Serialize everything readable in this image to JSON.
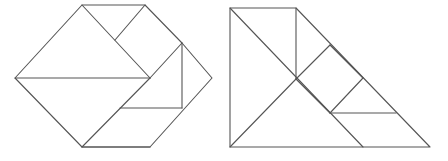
{
  "figure": {
    "name": "tangram-dissection-pair",
    "background_color": "#ffffff",
    "stroke_color": "#555555",
    "stroke_width": 1.1,
    "canvas": {
      "width": 448,
      "height": 161
    },
    "shapes": [
      {
        "id": "left-figure",
        "label": "left-tangram-hexagon",
        "outline": [
          [
            15,
            78
          ],
          [
            82,
            5
          ],
          [
            145,
            5
          ],
          [
            182,
            43
          ],
          [
            212,
            78
          ],
          [
            150,
            147
          ],
          [
            82,
            147
          ]
        ],
        "interior_segments": [
          {
            "name": "mid-horizontal",
            "points": [
              [
                15,
                78
              ],
              [
                150,
                78
              ]
            ]
          },
          {
            "name": "upper-left-diagonal",
            "points": [
              [
                82,
                5
              ],
              [
                150,
                78
              ]
            ]
          },
          {
            "name": "upper-notch-diagonal",
            "points": [
              [
                115,
                40
              ],
              [
                145,
                5
              ]
            ]
          },
          {
            "name": "right-upper-diagonal",
            "points": [
              [
                150,
                78
              ],
              [
                182,
                43
              ]
            ]
          },
          {
            "name": "vertical-right",
            "points": [
              [
                182,
                43
              ],
              [
                182,
                108
              ]
            ]
          },
          {
            "name": "lower-horizontal",
            "points": [
              [
                120,
                108
              ],
              [
                182,
                108
              ]
            ]
          },
          {
            "name": "lower-left-diagonal",
            "points": [
              [
                82,
                147
              ],
              [
                150,
                78
              ]
            ]
          },
          {
            "name": "bottom-horizontal",
            "points": [
              [
                82,
                147
              ],
              [
                150,
                147
              ]
            ]
          }
        ]
      },
      {
        "id": "right-figure",
        "label": "right-tangram-triangle",
        "outline": [
          [
            230,
            8
          ],
          [
            296,
            8
          ],
          [
            430,
            147
          ],
          [
            230,
            147
          ]
        ],
        "interior_segments": [
          {
            "name": "main-diagonal",
            "points": [
              [
                230,
                8
              ],
              [
                363,
                147
              ]
            ]
          },
          {
            "name": "vertical-left",
            "points": [
              [
                296,
                8
              ],
              [
                296,
                79
              ]
            ]
          },
          {
            "name": "square-upper-left",
            "points": [
              [
                296,
                79
              ],
              [
                330,
                45
              ]
            ]
          },
          {
            "name": "square-upper-right",
            "points": [
              [
                330,
                45
              ],
              [
                363,
                78
              ]
            ]
          },
          {
            "name": "square-lower-right",
            "points": [
              [
                363,
                78
              ],
              [
                330,
                113
              ]
            ]
          },
          {
            "name": "square-lower-left",
            "points": [
              [
                330,
                113
              ],
              [
                296,
                79
              ]
            ]
          },
          {
            "name": "small-horizontal",
            "points": [
              [
                330,
                113
              ],
              [
                396,
                113
              ]
            ]
          },
          {
            "name": "center-to-bottom-diagonal",
            "points": [
              [
                296,
                79
              ],
              [
                230,
                147
              ]
            ]
          }
        ]
      }
    ]
  }
}
